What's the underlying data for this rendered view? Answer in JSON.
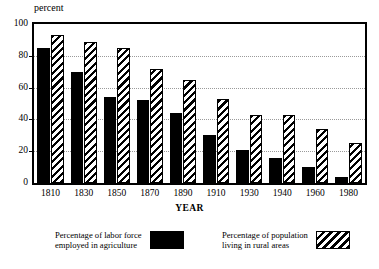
{
  "chart_data": {
    "type": "bar",
    "title": "",
    "xlabel": "YEAR",
    "ylabel": "percent",
    "ylim": [
      0,
      100
    ],
    "yticks": [
      0,
      20,
      40,
      60,
      80,
      100
    ],
    "grid": true,
    "legend_position": "bottom",
    "categories": [
      "1810",
      "1830",
      "1850",
      "1870",
      "1890",
      "1910",
      "1930",
      "1940",
      "1960",
      "1980"
    ],
    "series": [
      {
        "name": "Percentage of labor force\nemployed in agriculture",
        "pattern": "solid-black",
        "values": [
          85,
          70,
          54,
          52,
          44,
          30,
          21,
          16,
          10,
          4
        ]
      },
      {
        "name": "Percentage of population\nliving in rural areas",
        "pattern": "diagonal-hatch",
        "values": [
          93,
          89,
          85,
          72,
          65,
          53,
          43,
          43,
          34,
          25
        ]
      }
    ]
  },
  "axes": {
    "y_title": "percent",
    "x_title": "YEAR",
    "y_tick_labels": [
      "0",
      "20",
      "40",
      "60",
      "80",
      "100"
    ]
  },
  "legend": {
    "entries": [
      {
        "label": "Percentage of labor force\nemployed in agriculture",
        "swatch": "solid-black-swatch"
      },
      {
        "label": "Percentage of population\nliving in rural areas",
        "swatch": "diagonal-hatch-swatch"
      }
    ]
  },
  "colors": {
    "series_1": "#000000",
    "series_2_fill": "#ffffff",
    "series_2_stroke": "#000000",
    "axis": "#000000",
    "grid": "#9a9a9a",
    "background": "#ffffff"
  }
}
